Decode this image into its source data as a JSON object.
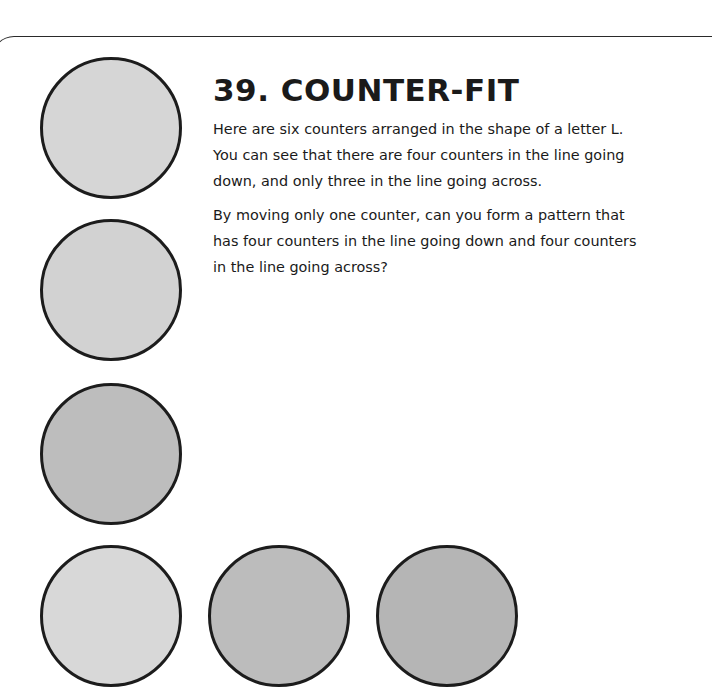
{
  "puzzle": {
    "title": "39. COUNTER-FIT",
    "paragraphs": [
      {
        "lines": [
          "Here are six counters arranged in the shape of a letter L.",
          "You can see that there are four counters in the line going",
          "down, and only three in the line going across."
        ]
      },
      {
        "lines": [
          "By moving only one counter, can you form a pattern that",
          "has four counters in the line going down and four counters",
          "in the line going across?"
        ]
      }
    ]
  },
  "counters": [
    {
      "id": 1,
      "group": "vertical",
      "fill": "#d6d6d6",
      "left": 40,
      "top": 57
    },
    {
      "id": 2,
      "group": "vertical",
      "fill": "#d2d2d2",
      "left": 40,
      "top": 219
    },
    {
      "id": 3,
      "group": "vertical",
      "fill": "#bdbdbd",
      "left": 40,
      "top": 383
    },
    {
      "id": 4,
      "group": "corner",
      "fill": "#d8d8d8",
      "left": 40,
      "top": 545
    },
    {
      "id": 5,
      "group": "horizontal",
      "fill": "#bcbcbc",
      "left": 208,
      "top": 545
    },
    {
      "id": 6,
      "group": "horizontal",
      "fill": "#b5b5b5",
      "left": 376,
      "top": 545
    }
  ],
  "colors": {
    "outline": "#1c1c1c",
    "frame_line": "#2a2a2a",
    "text": "#1a1a1a",
    "background": "#ffffff"
  }
}
